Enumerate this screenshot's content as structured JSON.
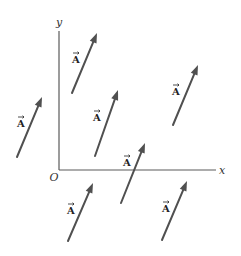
{
  "figure": {
    "axes": {
      "x_label": "x",
      "y_label": "y",
      "origin_label": "O",
      "origin_px": [
        59,
        170
      ],
      "x_axis_end_px": [
        216,
        170
      ],
      "y_axis_end_px": [
        59,
        31
      ]
    },
    "vector_label": "A",
    "vector_label_has_overarrow": true,
    "colors": {
      "vector": "#505050",
      "axis": "#5a5a5a",
      "text": "#222222",
      "background": "#ffffff"
    },
    "vectors": [
      {
        "id": "v1",
        "label": "A",
        "tail": [
          72,
          93
        ],
        "head": [
          97,
          33
        ],
        "label_pos": [
          76,
          63
        ]
      },
      {
        "id": "v2",
        "label": "A",
        "tail": [
          17,
          157
        ],
        "head": [
          42,
          97
        ],
        "label_pos": [
          21,
          127
        ]
      },
      {
        "id": "v3",
        "label": "A",
        "tail": [
          95,
          156
        ],
        "head": [
          118,
          90
        ],
        "label_pos": [
          97,
          121
        ]
      },
      {
        "id": "v4",
        "label": "A",
        "tail": [
          173,
          125
        ],
        "head": [
          198,
          65
        ],
        "label_pos": [
          176,
          95
        ]
      },
      {
        "id": "v5",
        "label": "A",
        "tail": [
          121,
          203
        ],
        "head": [
          145,
          143
        ],
        "label_pos": [
          127,
          166
        ]
      },
      {
        "id": "v6",
        "label": "A",
        "tail": [
          68,
          241
        ],
        "head": [
          93,
          183
        ],
        "label_pos": [
          71,
          214
        ]
      },
      {
        "id": "v7",
        "label": "A",
        "tail": [
          162,
          240
        ],
        "head": [
          187,
          181
        ],
        "label_pos": [
          166,
          212
        ]
      }
    ]
  }
}
